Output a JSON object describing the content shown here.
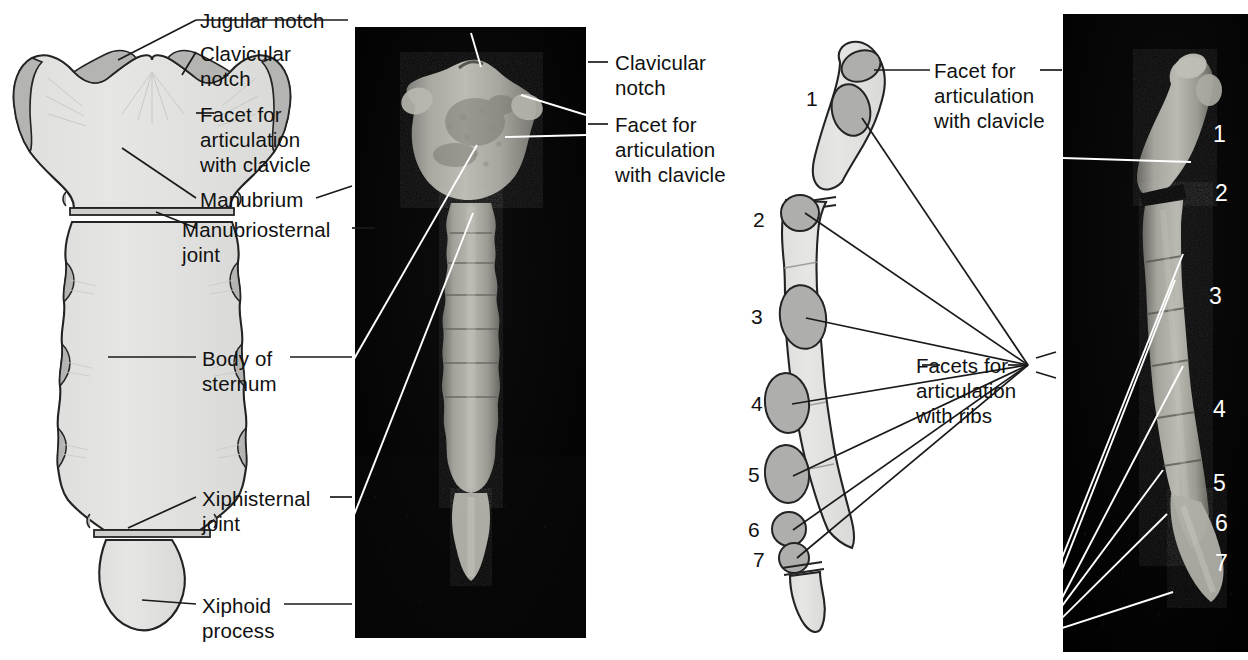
{
  "figure": {
    "type": "anatomical-illustration"
  },
  "panels": [
    {
      "id": "anterior-drawing",
      "kind": "line-drawing",
      "view": "anterior"
    },
    {
      "id": "anterior-photo",
      "kind": "photograph",
      "view": "anterior"
    },
    {
      "id": "lateral-drawing",
      "kind": "line-drawing",
      "view": "lateral"
    },
    {
      "id": "lateral-photo",
      "kind": "photograph",
      "view": "lateral"
    }
  ],
  "labels": {
    "jugular_notch": "Jugular notch",
    "clavicular_notch": "Clavicular\nnotch",
    "facet_clavicle": "Facet for\narticulation\nwith clavicle",
    "manubrium": "Manubrium",
    "manubriosternal_joint": "Manubriosternal\njoint",
    "body_of_sternum": "Body of\nsternum",
    "xiphisternal_joint": "Xiphisternal\njoint",
    "xiphoid_process": "Xiphoid\nprocess",
    "clavicular_notch_right": "Clavicular\nnotch",
    "facet_clavicle_right": "Facet for\narticulation\nwith clavicle",
    "facet_clavicle_lateral": "Facet for\narticulation\nwith clavicle",
    "facets_ribs": "Facets for\narticulation\nwith ribs"
  },
  "rib_numbers_drawing": [
    "1",
    "2",
    "3",
    "4",
    "5",
    "6",
    "7"
  ],
  "rib_numbers_photo": [
    "1",
    "2",
    "3",
    "4",
    "5",
    "6",
    "7"
  ],
  "colors": {
    "bone_fill": "#e3e3e1",
    "cartilage_fill": "#b4b4b2",
    "outline": "#1a1a1a",
    "photo_background": "#040404",
    "leader_line": "#1a1a1a",
    "leader_line_photo": "#ffffff",
    "text": "#111111"
  }
}
